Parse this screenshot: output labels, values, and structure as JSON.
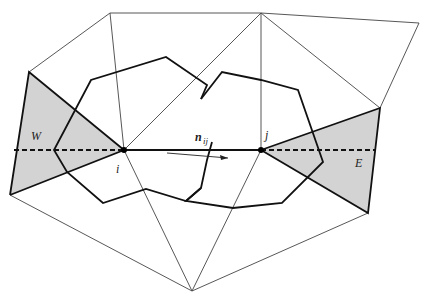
{
  "figure": {
    "labels": {
      "node_i": "i",
      "node_j": "j",
      "normal_main": "n",
      "normal_sub": "ij",
      "west": "W",
      "east": "E"
    },
    "colors": {
      "shaded_triangle": "#d3d3d3",
      "thin_mesh_line": "#444444",
      "thick_line": "#111111",
      "background": "#ffffff"
    },
    "nodes": {
      "i": [
        124,
        150
      ],
      "j": [
        261,
        150
      ],
      "top_left": [
        29,
        72
      ],
      "top_mid": [
        110,
        13
      ],
      "top_center": [
        261,
        13
      ],
      "top_right": [
        419,
        23
      ],
      "right": [
        380,
        108
      ],
      "bottom_right": [
        368,
        213
      ],
      "bottom": [
        192,
        291
      ],
      "bottom_left": [
        10,
        195
      ]
    }
  }
}
